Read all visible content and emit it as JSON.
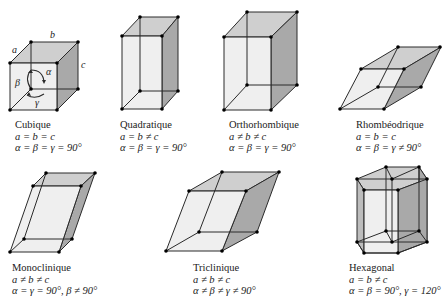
{
  "colors": {
    "edge": "#2a2a2a",
    "vertex": "#000000",
    "face_light": "#ececec",
    "face_top": "#cfcfcf",
    "face_side": "#a9a9a9",
    "face_mid": "#dcdcdc"
  },
  "cube_labels": {
    "a": "a",
    "b": "b",
    "c": "c",
    "alpha": "α",
    "beta": "β",
    "gamma": "γ"
  },
  "systems": [
    {
      "name": "Cubique",
      "lengths": "a = b = c",
      "angles": "α = β = γ = 90°"
    },
    {
      "name": "Quadratique",
      "lengths": "a = b ≠ c",
      "angles": "α = β = γ = 90°"
    },
    {
      "name": "Orthorhombique",
      "lengths": "a ≠ b ≠ c",
      "angles": "α = β = γ = 90°"
    },
    {
      "name": "Rhombéodrique",
      "lengths": "a = b = c",
      "angles": "α = β = γ ≠ 90°"
    },
    {
      "name": "Monoclinique",
      "lengths": "a ≠ b ≠ c",
      "angles": "α = γ = 90°, β ≠ 90°"
    },
    {
      "name": "Triclinique",
      "lengths": "a ≠ b ≠ c",
      "angles": "α ≠ β ≠ γ ≠ 90°"
    },
    {
      "name": "Hexagonal",
      "lengths": "a = b ≠ c",
      "angles": "α = β = 90°, γ = 120°"
    }
  ]
}
